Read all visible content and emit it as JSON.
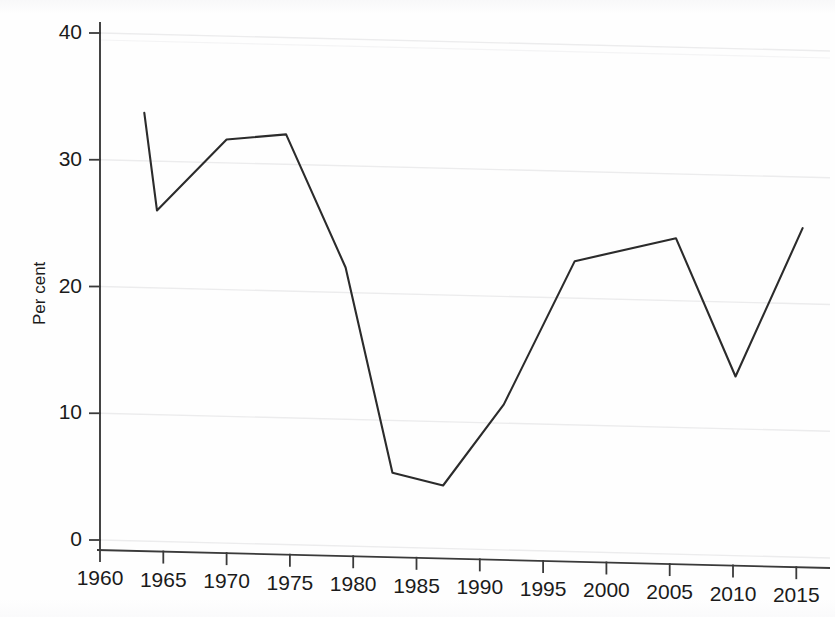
{
  "chart_data": {
    "type": "line",
    "title": "",
    "subtitle": "",
    "xlabel": "",
    "ylabel": "Per cent",
    "xlim": [
      1958.5,
      2017.5
    ],
    "ylim": [
      0,
      41.5
    ],
    "xticks": [
      1960,
      1965,
      1970,
      1975,
      1980,
      1985,
      1990,
      1995,
      2000,
      2005,
      2010,
      2015
    ],
    "xtick_labels": [
      "1960",
      "1965",
      "1970",
      "1975",
      "1980",
      "1985",
      "1990",
      "1995",
      "2000",
      "2005",
      "2010",
      "2015"
    ],
    "yticks": [
      0,
      10,
      20,
      30,
      40
    ],
    "ytick_labels": [
      "0",
      "10",
      "20",
      "30",
      "40"
    ],
    "grid": true,
    "grid_axis": "y",
    "grid_color": "#ececed",
    "legend": false,
    "legend_position": "none",
    "line_color": "#2b2b2b",
    "line_width": 2.1,
    "markers": false,
    "series": [
      {
        "name": "Per cent",
        "x": [
          1963.5,
          1964.5,
          1970.0,
          1974.7,
          1979.4,
          1983.1,
          1987.1,
          1991.9,
          1997.5,
          2005.5,
          2010.2,
          2015.5
        ],
        "values": [
          33.7,
          26.0,
          31.6,
          32.0,
          21.5,
          5.3,
          4.3,
          10.7,
          22.0,
          23.8,
          12.9,
          24.6
        ]
      }
    ],
    "annotations": []
  },
  "axes": {
    "y_axis_label": "Per cent",
    "y_axis_name": "y-axis",
    "x_axis_name": "x-axis"
  }
}
